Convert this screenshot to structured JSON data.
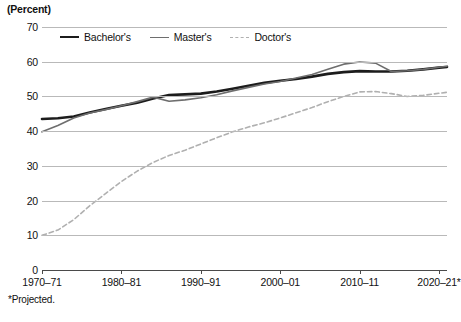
{
  "axis_unit_label": "(Percent)",
  "footnote": "*Projected.",
  "legend": {
    "items": [
      {
        "label": "Bachelor's",
        "key": "bachelors",
        "color": "#1c1c1c"
      },
      {
        "label": "Master's",
        "key": "masters",
        "color": "#6e6e6e"
      },
      {
        "label": "Doctor's",
        "key": "doctors",
        "color": "#b0b0b0"
      }
    ]
  },
  "chart_data": {
    "type": "line",
    "title": "",
    "subtitle": "",
    "xlabel": "",
    "ylabel": "(Percent)",
    "ylim": [
      0,
      70
    ],
    "xlim": [
      1970,
      2021
    ],
    "grid": true,
    "legend_position": "top-inside",
    "annotations": [
      "*Projected."
    ],
    "yticks": [
      0,
      10,
      20,
      30,
      40,
      50,
      60,
      70
    ],
    "ytick_labels": [
      "0",
      "10",
      "20",
      "30",
      "40",
      "50",
      "60",
      "70"
    ],
    "xticks": [
      1970,
      1980,
      1990,
      2000,
      2010,
      2020
    ],
    "xtick_labels": [
      "1970–71",
      "1980–81",
      "1990–91",
      "2000–01",
      "2010–11",
      "2020–21*"
    ],
    "series": [
      {
        "name": "Bachelor's",
        "color": "#1c1c1c",
        "style": "solid",
        "width": 2.6,
        "x": [
          1970,
          1972,
          1974,
          1976,
          1978,
          1980,
          1982,
          1984,
          1986,
          1988,
          1990,
          1992,
          1994,
          1996,
          1998,
          2000,
          2002,
          2004,
          2006,
          2008,
          2010,
          2012,
          2014,
          2016,
          2018,
          2020,
          2021
        ],
        "values": [
          43.5,
          43.7,
          44.2,
          45.4,
          46.4,
          47.3,
          48.2,
          49.4,
          50.4,
          50.6,
          50.8,
          51.4,
          52.2,
          53.1,
          53.9,
          54.5,
          55.0,
          55.7,
          56.5,
          57.0,
          57.3,
          57.2,
          57.2,
          57.4,
          57.8,
          58.3,
          58.5
        ]
      },
      {
        "name": "Master's",
        "color": "#6e6e6e",
        "style": "solid",
        "width": 1.6,
        "x": [
          1970,
          1972,
          1974,
          1976,
          1978,
          1980,
          1982,
          1984,
          1986,
          1988,
          1990,
          1992,
          1994,
          1996,
          1998,
          2000,
          2002,
          2004,
          2006,
          2008,
          2010,
          2012,
          2014,
          2016,
          2018,
          2020,
          2021
        ],
        "values": [
          39.8,
          41.6,
          43.8,
          45.2,
          46.2,
          47.3,
          48.5,
          49.8,
          48.6,
          49.0,
          49.6,
          50.5,
          51.6,
          52.6,
          53.6,
          54.3,
          55.3,
          56.3,
          57.8,
          59.3,
          59.9,
          59.6,
          57.2,
          57.4,
          57.8,
          58.4,
          58.7
        ]
      },
      {
        "name": "Doctor's",
        "color": "#b0b0b0",
        "style": "dashed",
        "width": 1.6,
        "x": [
          1970,
          1972,
          1974,
          1976,
          1978,
          1980,
          1982,
          1984,
          1986,
          1988,
          1990,
          1992,
          1994,
          1996,
          1998,
          2000,
          2002,
          2004,
          2006,
          2008,
          2010,
          2012,
          2014,
          2016,
          2018,
          2020,
          2021
        ],
        "values": [
          10.0,
          11.5,
          14.5,
          18.5,
          22.0,
          25.5,
          28.5,
          31.0,
          33.0,
          34.5,
          36.3,
          38.1,
          39.8,
          41.2,
          42.4,
          43.8,
          45.3,
          46.8,
          48.5,
          50.0,
          51.3,
          51.4,
          50.8,
          50.0,
          50.3,
          50.9,
          51.2
        ]
      }
    ]
  }
}
